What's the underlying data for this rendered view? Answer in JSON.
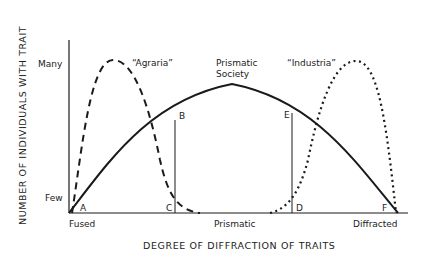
{
  "diagram": {
    "y_axis_title": "NUMBER OF INDIVIDUALS WITH TRAIT",
    "x_axis_title": "DEGREE OF DIFFRACTION OF TRAITS",
    "y_ticks": {
      "high": "Many",
      "low": "Few"
    },
    "x_ticks": {
      "left": "Fused",
      "middle": "Prismatic",
      "right": "Diffracted"
    },
    "curves": [
      {
        "id": "agraria",
        "label": "“Agraria”",
        "style": "dashed"
      },
      {
        "id": "prismatic",
        "label_line1": "Prismatic",
        "label_line2": "Society",
        "style": "solid"
      },
      {
        "id": "industria",
        "label": "“Industria”",
        "style": "dotted"
      }
    ],
    "points": {
      "A": "A",
      "B": "B",
      "C": "C",
      "D": "D",
      "E": "E",
      "F": "F"
    },
    "colors": {
      "ink": "#1a1a1a",
      "background": "#ffffff"
    }
  }
}
